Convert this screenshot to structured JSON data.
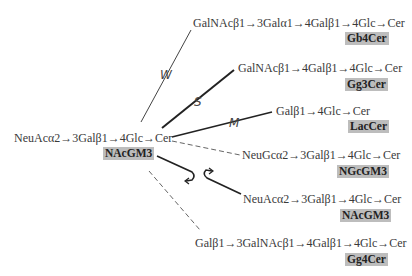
{
  "source": {
    "chain": "NeuAcα2→3Galβ1→4Glc→Cer",
    "name": "NAcGM3"
  },
  "products": [
    {
      "id": "gb4",
      "chain": "GalNAcβ1→3Galα1→4Galβ1→4Glc→Cer",
      "name": "Gb4Cer",
      "edge_label": "W",
      "edge_style": "thin-solid"
    },
    {
      "id": "gg3",
      "chain": "GalNAcβ1→4Galβ1→4Glc→Cer",
      "name": "Gg3Cer",
      "edge_label": "S",
      "edge_style": "thick-solid"
    },
    {
      "id": "lac",
      "chain": "Galβ1→4Glc→Cer",
      "name": "LacCer",
      "edge_label": "M",
      "edge_style": "medium-solid"
    },
    {
      "id": "ngc",
      "chain": "NeuGcα2→3Galβ1→4Glc→Cer",
      "name": "NGcGM3",
      "edge_label": "",
      "edge_style": "dashed"
    },
    {
      "id": "nac",
      "chain": "NeuAcα2→3Galβ1→4Glc→Cer",
      "name": "NAcGM3",
      "edge_label": "",
      "edge_style": "thick-solid-curved-arrows"
    },
    {
      "id": "gg4",
      "chain": "Galβ1→3GalNAcβ1→4Galβ1→4Glc→Cer",
      "name": "Gg4Cer",
      "edge_label": "",
      "edge_style": "dashed"
    }
  ],
  "colors": {
    "tag_background": "#bdbdbd",
    "line": "#333333",
    "dashed_line": "#666666"
  }
}
